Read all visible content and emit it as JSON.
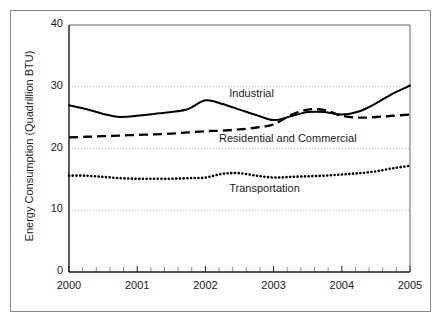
{
  "chart_data": {
    "type": "line",
    "title": "",
    "subtitle": "",
    "xlabel": "",
    "ylabel": "Energy Consumption (Quadrillion BTU)",
    "xlim": [
      2000,
      2005
    ],
    "ylim": [
      0,
      40
    ],
    "yticks": [
      0,
      10,
      20,
      30,
      40
    ],
    "ytick_labels": [
      "0",
      "10",
      "20",
      "30",
      "40"
    ],
    "xticks": [
      2000,
      2001,
      2002,
      2003,
      2004,
      2005
    ],
    "xtick_labels": [
      "2000",
      "2001",
      "2002",
      "2003",
      "2004",
      "2005"
    ],
    "x_minor_ticks_per_interval": 4,
    "grid": true,
    "grid_axis": "y",
    "grid_style": "dotted",
    "legend_position": "inline-annotations",
    "x": [
      2000.0,
      2000.25,
      2000.5,
      2000.75,
      2001.0,
      2001.25,
      2001.5,
      2001.75,
      2002.0,
      2002.25,
      2002.5,
      2002.75,
      2003.0,
      2003.25,
      2003.5,
      2003.75,
      2004.0,
      2004.25,
      2004.5,
      2004.75,
      2005.0
    ],
    "series": [
      {
        "name": "Industrial",
        "line_style": "solid",
        "color": "#000000",
        "label_x": 2002.35,
        "label_y": 28.6,
        "values": [
          27.0,
          26.4,
          25.6,
          25.1,
          25.3,
          25.6,
          25.9,
          26.4,
          27.8,
          27.2,
          26.3,
          25.4,
          24.6,
          25.2,
          25.9,
          25.9,
          25.5,
          26.0,
          27.3,
          28.9,
          30.2
        ]
      },
      {
        "name": "Residential and Commercial",
        "line_style": "dashed",
        "color": "#000000",
        "label_x": 2002.2,
        "label_y": 21.4,
        "values": [
          21.8,
          21.9,
          22.0,
          22.1,
          22.2,
          22.3,
          22.4,
          22.6,
          22.8,
          22.9,
          23.1,
          23.4,
          23.9,
          25.4,
          26.3,
          26.2,
          25.3,
          25.0,
          25.1,
          25.3,
          25.5
        ]
      },
      {
        "name": "Transportation",
        "line_style": "dotted",
        "color": "#000000",
        "label_x": 2002.35,
        "label_y": 13.2,
        "values": [
          15.6,
          15.6,
          15.4,
          15.2,
          15.1,
          15.1,
          15.1,
          15.2,
          15.3,
          15.9,
          16.0,
          15.6,
          15.3,
          15.4,
          15.5,
          15.6,
          15.8,
          16.0,
          16.3,
          16.8,
          17.2
        ]
      }
    ]
  }
}
